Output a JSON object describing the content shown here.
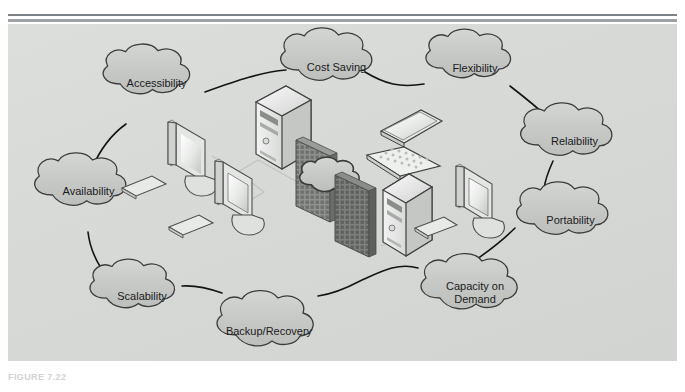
{
  "figure": {
    "caption": "FIGURE 7.22",
    "panel_color": "#d9dbd9",
    "rule_color": "#8d9196",
    "cloud_fill": "#c9cbc9",
    "cloud_stroke": "#3a3a3a",
    "link_color": "#1a1a1a"
  },
  "benefit_clouds": [
    {
      "id": "accessibility",
      "label": "Accessibility",
      "line2": ""
    },
    {
      "id": "cost-saving",
      "label": "Cost Saving",
      "line2": ""
    },
    {
      "id": "flexibility",
      "label": "Flexibility",
      "line2": ""
    },
    {
      "id": "relaibility",
      "label": "Relaibility",
      "line2": ""
    },
    {
      "id": "portability",
      "label": "Portability",
      "line2": ""
    },
    {
      "id": "capacity-on-demand",
      "label": "Capacity on",
      "line2": "Demand"
    },
    {
      "id": "backup-recovery",
      "label": "Backup/Recovery",
      "line2": ""
    },
    {
      "id": "scalability",
      "label": "Scalability",
      "line2": ""
    },
    {
      "id": "availability",
      "label": "Availability",
      "line2": ""
    }
  ],
  "network_devices": [
    {
      "id": "desktop-1",
      "icon": "desktop-computer-icon"
    },
    {
      "id": "desktop-2",
      "icon": "desktop-computer-icon"
    },
    {
      "id": "server-1",
      "icon": "tower-server-icon"
    },
    {
      "id": "firewall-1",
      "icon": "firewall-icon"
    },
    {
      "id": "internet-cloud",
      "icon": "cloud-icon"
    },
    {
      "id": "firewall-2",
      "icon": "firewall-icon"
    },
    {
      "id": "laptop-1",
      "icon": "laptop-icon"
    },
    {
      "id": "server-2",
      "icon": "tower-server-icon"
    },
    {
      "id": "desktop-3",
      "icon": "desktop-computer-icon"
    }
  ]
}
